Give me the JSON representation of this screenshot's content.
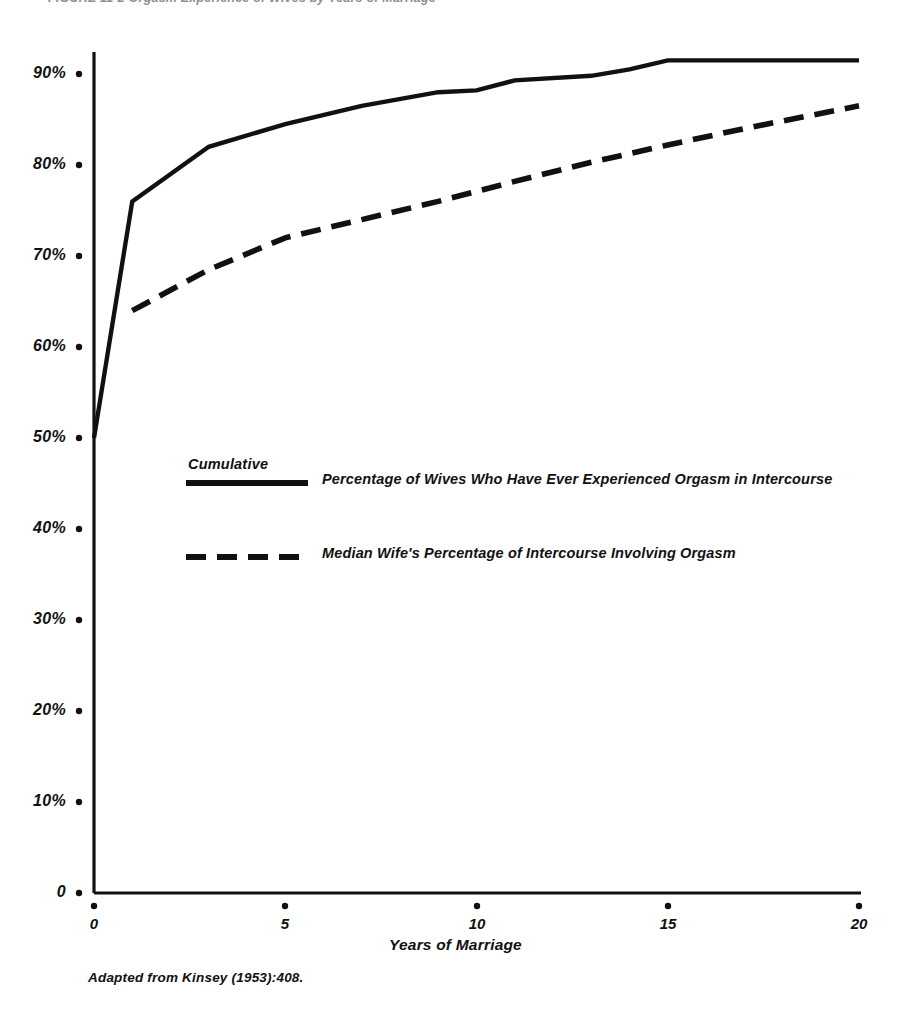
{
  "figure": {
    "caption": "FIGURE 11-2   Orgasm Experience of Wives by Years of Marriage",
    "source_note": "Adapted from Kinsey (1953):408."
  },
  "axes": {
    "x_title": "Years of Marriage",
    "x_tick_labels": [
      "0",
      "5",
      "10",
      "15",
      "20"
    ],
    "y_tick_labels": [
      "90%",
      "80%",
      "70%",
      "60%",
      "50%",
      "40%",
      "30%",
      "20%",
      "10%",
      "0"
    ]
  },
  "legend": {
    "heading": "Cumulative",
    "entries": [
      {
        "style": "solid",
        "label": "Percentage of Wives Who Have Ever Experienced  Orgasm in Intercourse"
      },
      {
        "style": "dashed",
        "label": "Median Wife's Percentage of Intercourse Involving  Orgasm"
      }
    ]
  },
  "colors": {
    "ink": "#111111",
    "paper": "#ffffff"
  },
  "chart_data": {
    "type": "line",
    "title": "FIGURE 11-2   Orgasm Experience of Wives by Years of Marriage",
    "xlabel": "Years of Marriage",
    "ylabel": "",
    "xlim": [
      0,
      20
    ],
    "ylim": [
      0,
      95
    ],
    "grid": false,
    "legend_position": "inside-center",
    "xticks": [
      0,
      5,
      10,
      15,
      20
    ],
    "yticks": [
      0,
      10,
      20,
      30,
      40,
      50,
      60,
      70,
      80,
      90
    ],
    "ytick_labels": [
      "0",
      "10%",
      "20%",
      "30%",
      "40%",
      "50%",
      "60%",
      "70%",
      "80%",
      "90%"
    ],
    "series": [
      {
        "name": "Cumulative Percentage of Wives Who Have Ever Experienced Orgasm in Intercourse",
        "style": "solid",
        "x": [
          0,
          1,
          3,
          5,
          7,
          9,
          10,
          11,
          13,
          14,
          15,
          17,
          20
        ],
        "values": [
          50,
          76,
          82,
          84.5,
          86.5,
          88,
          88.2,
          89.3,
          89.8,
          90.5,
          91.5,
          91.5,
          91.5
        ]
      },
      {
        "name": "Median Wife's Percentage of Intercourse Involving Orgasm",
        "style": "dashed",
        "x": [
          1,
          3,
          5,
          7,
          9,
          11,
          13,
          15,
          17,
          20
        ],
        "values": [
          64,
          68.5,
          72,
          74,
          76,
          78.2,
          80.3,
          82.2,
          84,
          86.5
        ]
      }
    ]
  }
}
